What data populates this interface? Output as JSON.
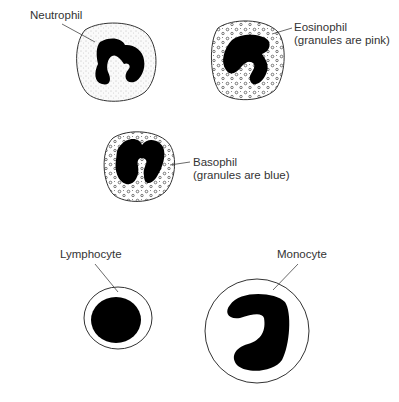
{
  "figure": {
    "cells": [
      {
        "id": "neutrophil",
        "label": "Neutrophil",
        "sublabel": ""
      },
      {
        "id": "eosinophil",
        "label": "Eosinophil",
        "sublabel": "(granules are pink)"
      },
      {
        "id": "basophil",
        "label": "Basophil",
        "sublabel": "(granules are blue)"
      },
      {
        "id": "lymphocyte",
        "label": "Lymphocyte",
        "sublabel": ""
      },
      {
        "id": "monocyte",
        "label": "Monocyte",
        "sublabel": ""
      }
    ],
    "colors": {
      "outline": "#333333",
      "nucleus": "#000000",
      "cytoplasm_stipple": "#f2f2f2",
      "background": "#ffffff"
    }
  }
}
